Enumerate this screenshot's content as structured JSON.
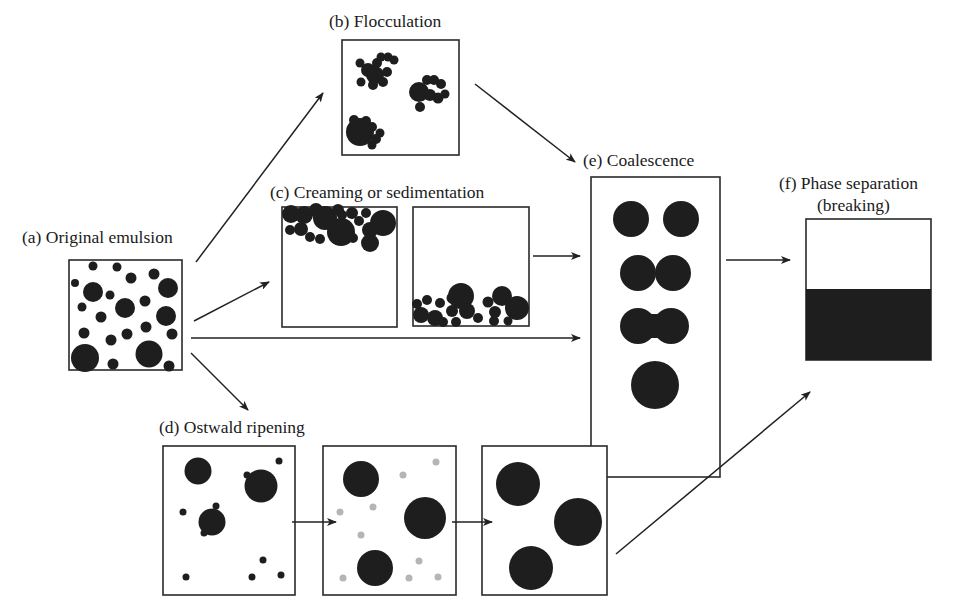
{
  "figure": {
    "type": "emulsion-instability-mechanisms",
    "stages": {
      "a": {
        "label": "(a) Original emulsion"
      },
      "b": {
        "label": "(b) Flocculation"
      },
      "c": {
        "label": "(c) Creaming or sedimentation"
      },
      "d": {
        "label": "(d) Ostwald ripening"
      },
      "e": {
        "label": "(e) Coalescence"
      },
      "f": {
        "label_line1": "(f) Phase separation",
        "label_line2": "(breaking)"
      }
    },
    "flows": [
      {
        "from": "a",
        "to": "b"
      },
      {
        "from": "a",
        "to": "c"
      },
      {
        "from": "a",
        "to": "e"
      },
      {
        "from": "a",
        "to": "d"
      },
      {
        "from": "b",
        "to": "e"
      },
      {
        "from": "c",
        "to": "e"
      },
      {
        "from": "e",
        "to": "f"
      },
      {
        "from": "d",
        "to": "f"
      }
    ],
    "colors": {
      "droplet": "#1e1e1e",
      "dissolving_droplet": "#b5b5b5",
      "frame": "#2a2a2a",
      "background": "#ffffff"
    }
  }
}
